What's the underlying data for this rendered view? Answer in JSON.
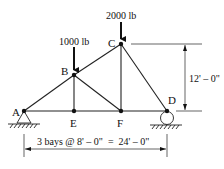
{
  "diagram": {
    "type": "truss",
    "nodes": [
      {
        "id": "A",
        "label": "A",
        "x": 24,
        "y": 111
      },
      {
        "id": "B",
        "label": "B",
        "x": 74,
        "y": 75
      },
      {
        "id": "C",
        "label": "C",
        "x": 121,
        "y": 44
      },
      {
        "id": "D",
        "label": "D",
        "x": 167,
        "y": 111
      },
      {
        "id": "E",
        "label": "E",
        "x": 74,
        "y": 111
      },
      {
        "id": "F",
        "label": "F",
        "x": 121,
        "y": 111
      }
    ],
    "members": [
      [
        "A",
        "B"
      ],
      [
        "B",
        "C"
      ],
      [
        "C",
        "D"
      ],
      [
        "A",
        "E"
      ],
      [
        "E",
        "F"
      ],
      [
        "F",
        "D"
      ],
      [
        "B",
        "E"
      ],
      [
        "B",
        "F"
      ],
      [
        "C",
        "F"
      ]
    ],
    "loads": [
      {
        "node": "B",
        "label": "1000 lb"
      },
      {
        "node": "C",
        "label": "2000 lb"
      }
    ],
    "supports": [
      {
        "node": "A",
        "type": "pin"
      },
      {
        "node": "D",
        "type": "roller"
      }
    ],
    "dimensions": {
      "height": "12' – 0\"",
      "span": "3 bays @ 8' – 0\"  =  24' – 0\""
    }
  }
}
